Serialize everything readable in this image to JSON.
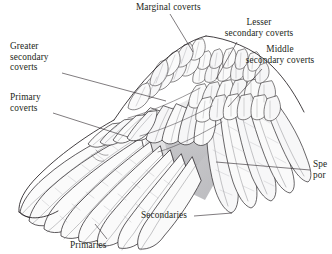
{
  "figure": {
    "background_color": "#ffffff",
    "ink_color": "#231f20",
    "shading_color": "#9a9a9e",
    "width": 332,
    "height": 254
  },
  "labels": {
    "marginal_coverts": {
      "lines": [
        "Marginal coverts"
      ],
      "align": "left",
      "x": 136,
      "y": 2,
      "leader": {
        "x1": 170,
        "y1": 14,
        "x2": 193,
        "y2": 52
      }
    },
    "lesser_secondary_coverts": {
      "lines": [
        "Lesser",
        "secondary coverts"
      ],
      "align": "center",
      "x": 213,
      "y": 17,
      "leader": {
        "x1": 237,
        "y1": 42,
        "x2": 216,
        "y2": 79
      }
    },
    "middle_secondary_coverts": {
      "lines": [
        "Middle",
        "secondary coverts"
      ],
      "align": "center",
      "x": 231,
      "y": 44,
      "leader": {
        "x1": 262,
        "y1": 69,
        "x2": 228,
        "y2": 107
      }
    },
    "greater_secondary_coverts": {
      "lines": [
        "Greater",
        "secondary",
        "coverts"
      ],
      "align": "left",
      "x": 10,
      "y": 41,
      "leader": {
        "x1": 62,
        "y1": 73,
        "x2": 166,
        "y2": 101
      }
    },
    "primary_coverts": {
      "lines": [
        "Primary",
        "coverts"
      ],
      "align": "left",
      "x": 10,
      "y": 92,
      "leader": {
        "x1": 53,
        "y1": 113,
        "x2": 128,
        "y2": 137
      }
    },
    "speculum_portion": {
      "lines": [
        "Spe",
        "por"
      ],
      "clipped": true,
      "align": "left",
      "x": 313,
      "y": 159,
      "leader": {
        "x1": 310,
        "y1": 170,
        "x2": 216,
        "y2": 162
      }
    },
    "secondaries": {
      "lines": [
        "Secondaries"
      ],
      "align": "left",
      "x": 141,
      "y": 210,
      "leader": {
        "x1": 194,
        "y1": 216,
        "x2": 232,
        "y2": 213
      }
    },
    "primaries": {
      "lines": [
        "Primaries"
      ],
      "align": "left",
      "x": 70,
      "y": 240,
      "leader": {
        "x1": 107,
        "y1": 239,
        "x2": 95,
        "y2": 224
      }
    }
  }
}
